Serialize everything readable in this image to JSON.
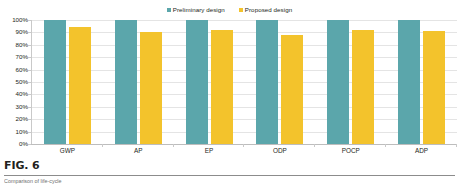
{
  "figure": {
    "number_label": "FIG. 6",
    "caption_text": "Comparison of life-cycle"
  },
  "legend": {
    "position": "top-center",
    "entries": [
      {
        "label": "Preliminary design",
        "color": "#5ba6ab",
        "swatch_icon": "square-swatch-icon"
      },
      {
        "label": "Proposed design",
        "color": "#f3c32c",
        "swatch_icon": "square-swatch-icon"
      }
    ]
  },
  "chart_data": {
    "type": "bar",
    "title": "",
    "subtitle": "",
    "xlabel": "",
    "ylabel": "",
    "categories": [
      "GWP",
      "AP",
      "EP",
      "ODP",
      "POCP",
      "ADP"
    ],
    "series": [
      {
        "name": "Preliminary design",
        "color": "#5ba6ab",
        "values": [
          100,
          100,
          100,
          100,
          100,
          100
        ]
      },
      {
        "name": "Proposed design",
        "color": "#f3c32c",
        "values": [
          94,
          90,
          92,
          88,
          92,
          91
        ]
      }
    ],
    "ylim": [
      0,
      100
    ],
    "ytick_values": [
      0,
      10,
      20,
      30,
      40,
      50,
      60,
      70,
      80,
      90,
      100
    ],
    "ytick_labels": [
      "0%",
      "10%",
      "20%",
      "30%",
      "40%",
      "50%",
      "60%",
      "70%",
      "80%",
      "90%",
      "100%"
    ],
    "value_suffix": "%",
    "grid": true,
    "grid_axis": "y",
    "legend_position": "top-center",
    "bar_orientation": "vertical",
    "grouped": true
  },
  "colors": {
    "series_preliminary": "#5ba6ab",
    "series_proposed": "#f3c32c",
    "gridline": "#e4e4e4",
    "axis": "#c9c9c9",
    "text": "#231f20",
    "background": "#ffffff",
    "caption_rule": "#8c8c8c"
  }
}
